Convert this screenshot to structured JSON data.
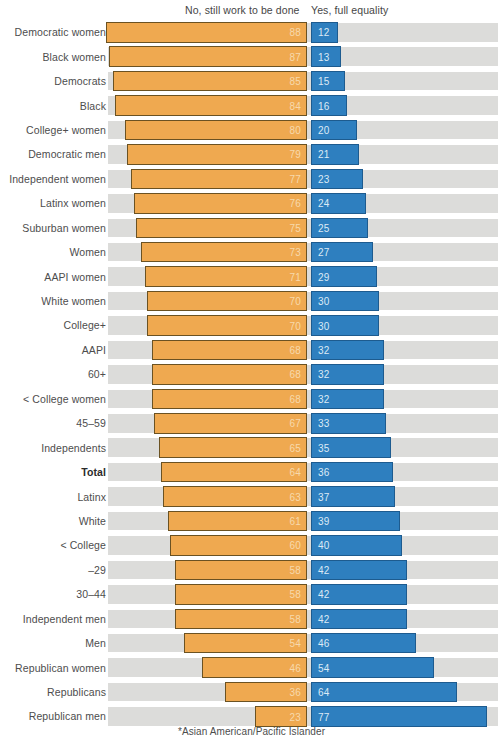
{
  "legend": {
    "no_label": "No, still work to be done",
    "yes_label": "Yes, full equality"
  },
  "footnote": "*Asian American/Pacific Islander",
  "colors": {
    "no": "#efa950",
    "yes": "#2e7fbf",
    "track": "#dcdcda",
    "background": "#ffffff"
  },
  "chart_data": {
    "type": "bar",
    "title": "",
    "subtitle": "",
    "xlabel": "",
    "ylabel": "",
    "xlim": [
      0,
      100
    ],
    "grid": false,
    "orientation": "horizontal",
    "layout": "diverging-stacked",
    "legend_position": "top",
    "note": "*Asian American/Pacific Islander",
    "categories": [
      "Democratic women",
      "Black women",
      "Democrats",
      "Black",
      "College+ women",
      "Democratic men",
      "Independent women",
      "Latinx women",
      "Suburban women",
      "Women",
      "AAPI women",
      "White women",
      "College+",
      "AAPI",
      "60+",
      "< College women",
      "45–59",
      "Independents",
      "Total",
      "Latinx",
      "White",
      "< College",
      "–29",
      "30–44",
      "Independent men",
      "Men",
      "Republican women",
      "Republicans",
      "Republican men"
    ],
    "highlight_category": "Total",
    "series": [
      {
        "name": "No, still work to be done",
        "color": "#efa950",
        "values": [
          88,
          87,
          85,
          84,
          80,
          79,
          77,
          76,
          75,
          73,
          71,
          70,
          70,
          68,
          68,
          68,
          67,
          65,
          64,
          63,
          61,
          60,
          58,
          58,
          58,
          54,
          46,
          36,
          23
        ]
      },
      {
        "name": "Yes, full equality",
        "color": "#2e7fbf",
        "values": [
          12,
          13,
          15,
          16,
          20,
          21,
          23,
          24,
          25,
          27,
          29,
          30,
          30,
          32,
          32,
          32,
          33,
          35,
          36,
          37,
          39,
          40,
          42,
          42,
          42,
          46,
          54,
          64,
          77
        ]
      }
    ]
  }
}
